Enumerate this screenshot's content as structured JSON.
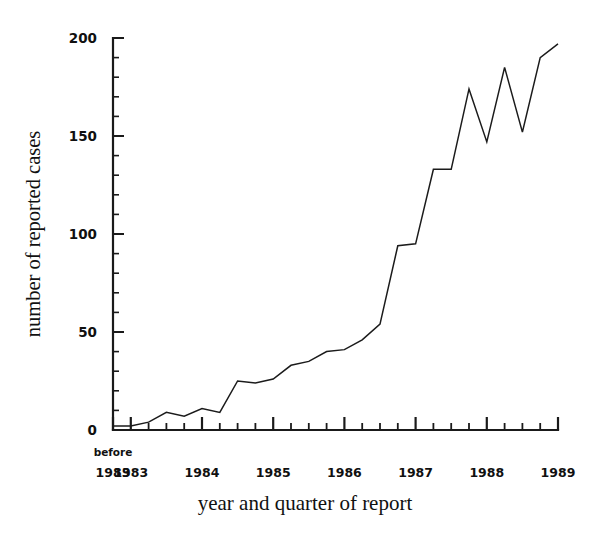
{
  "figure": {
    "background": "#ffffff",
    "ink_color": "#1a1a1a"
  },
  "axis_titles": {
    "y": "number of reported cases",
    "x": "year and quarter of report"
  },
  "y_ticks": {
    "labels": [
      "0",
      "50",
      "100",
      "150",
      "200"
    ],
    "values": [
      0,
      50,
      100,
      150,
      200
    ],
    "minor_step": 10
  },
  "x_tick_labels": [
    {
      "line1": "before",
      "line2": "1983"
    },
    {
      "line1": "",
      "line2": "1983"
    },
    {
      "line1": "",
      "line2": "1984"
    },
    {
      "line1": "",
      "line2": "1985"
    },
    {
      "line1": "",
      "line2": "1986"
    },
    {
      "line1": "",
      "line2": "1987"
    },
    {
      "line1": "",
      "line2": "1988"
    },
    {
      "line1": "",
      "line2": "1989"
    }
  ],
  "chart_data": {
    "type": "line",
    "title": "",
    "xlabel": "year and quarter of report",
    "ylabel": "number of reported cases",
    "ylim": [
      0,
      200
    ],
    "grid": false,
    "legend": null,
    "x": [
      "before 1983",
      "1983 Q1",
      "1983 Q2",
      "1983 Q3",
      "1983 Q4",
      "1984 Q1",
      "1984 Q2",
      "1984 Q3",
      "1984 Q4",
      "1985 Q1",
      "1985 Q2",
      "1985 Q3",
      "1985 Q4",
      "1986 Q1",
      "1986 Q2",
      "1986 Q3",
      "1986 Q4",
      "1987 Q1",
      "1987 Q2",
      "1987 Q3",
      "1987 Q4",
      "1988 Q1",
      "1988 Q2",
      "1988 Q3",
      "1988 Q4",
      "1989 Q1"
    ],
    "values": [
      2,
      2,
      4,
      9,
      7,
      11,
      9,
      25,
      24,
      26,
      33,
      35,
      40,
      41,
      46,
      54,
      94,
      95,
      133,
      133,
      174,
      147,
      185,
      152,
      190,
      197
    ],
    "series": [
      {
        "name": "reported cases",
        "values": [
          2,
          2,
          4,
          9,
          7,
          11,
          9,
          25,
          24,
          26,
          33,
          35,
          40,
          41,
          46,
          54,
          94,
          95,
          133,
          133,
          174,
          147,
          185,
          152,
          190,
          197
        ]
      }
    ],
    "xlim_quarters": [
      0,
      25
    ],
    "ytick_values": [
      0,
      50,
      100,
      150,
      200
    ],
    "color": "#1b1b1b"
  },
  "geometry": {
    "plot_left": 113,
    "plot_right": 558,
    "plot_top": 38,
    "plot_bottom": 430
  }
}
